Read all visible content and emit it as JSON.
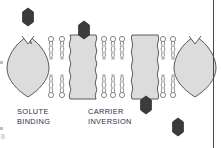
{
  "figure": {
    "stages": [
      {
        "id": "solute-binding",
        "label_line1": "SOLUTE",
        "label_line2": "BINDING"
      },
      {
        "id": "carrier-inversion",
        "label_line1": "CARRIER",
        "label_line2": "INVERSION"
      }
    ],
    "captions": {
      "solute_binding_line1": "SOLUTE",
      "solute_binding_line2": "BINDING",
      "carrier_inversion_line1": "CARRIER",
      "carrier_inversion_line2": "INVERSION"
    },
    "colors": {
      "protein_fill": "#dcdcdc",
      "protein_stroke": "#5a5a5a",
      "solute_fill": "#3c3c3c",
      "solute_stroke": "#2a2a2a",
      "lipid_stroke": "#7a7a7a",
      "lipid_head_fill": "#ffffff",
      "caption_text": "#2b2f4a",
      "page_border": "#4a4a4a",
      "background": "#ffffff"
    },
    "membrane": {
      "top_y": 35,
      "bottom_y": 98,
      "outer_leaflet_label": "outer leaflet",
      "inner_leaflet_label": "inner leaflet"
    },
    "carrier_proteins": [
      {
        "id": "carrier-1-open-out",
        "shape": "lens-notched-top",
        "x": 14,
        "state": "open outward, empty"
      },
      {
        "id": "carrier-2-loaded",
        "shape": "wavy-column",
        "x": 69,
        "state": "solute bound, outward"
      },
      {
        "id": "carrier-3-inverted",
        "shape": "wavy-column",
        "x": 131,
        "state": "inverted, releasing solute"
      },
      {
        "id": "carrier-4-open-out",
        "shape": "lens-notched-top",
        "x": 182,
        "state": "reset, open outward"
      }
    ],
    "solute_molecules": [
      {
        "id": "solute-free-top",
        "x": 28,
        "y": 17,
        "position": "extracellular, unbound"
      },
      {
        "id": "solute-bound-top",
        "x": 84,
        "y": 29,
        "position": "bound at outer face"
      },
      {
        "id": "solute-bound-bottom",
        "x": 146,
        "y": 104,
        "position": "bound at inner face"
      },
      {
        "id": "solute-free-bottom",
        "x": 178,
        "y": 127,
        "position": "intracellular, released"
      }
    ],
    "phospholipid_columns": [
      {
        "x": 50,
        "leaflets": "both"
      },
      {
        "x": 61,
        "leaflets": "both"
      },
      {
        "x": 104,
        "leaflets": "both"
      },
      {
        "x": 113,
        "leaflets": "both"
      },
      {
        "x": 122,
        "leaflets": "both"
      },
      {
        "x": 163,
        "leaflets": "both"
      },
      {
        "x": 173,
        "leaflets": "both"
      }
    ]
  }
}
